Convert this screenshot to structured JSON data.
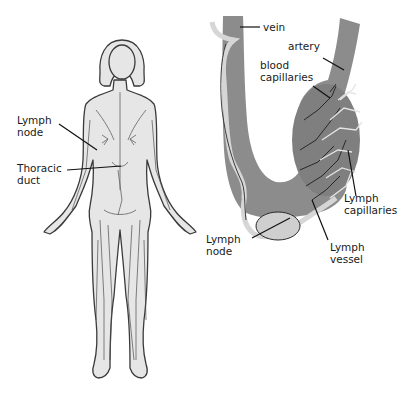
{
  "diagram": {
    "type": "anatomical-illustration",
    "colors": {
      "background": "#ffffff",
      "body_fill": "#e6e6e6",
      "outline": "#3a3a3a",
      "blood_vessel": "#8c8c8c",
      "lymph_vessel": "#d9d9d9",
      "lymph_node": "#cfcfcf",
      "leader_line": "#111111"
    },
    "left_panel": {
      "title": "female body lymphatic network",
      "labels": [
        {
          "id": "lymph_node",
          "line1": "Lymph",
          "line2": "node"
        },
        {
          "id": "thoracic_duct",
          "line1": "Thoracic",
          "line2": "duct"
        }
      ]
    },
    "right_panel": {
      "title": "blood vessels and lymph capillaries",
      "labels": [
        {
          "id": "vein",
          "line1": "vein",
          "line2": ""
        },
        {
          "id": "artery",
          "line1": "artery",
          "line2": ""
        },
        {
          "id": "blood_capillaries",
          "line1": "blood",
          "line2": "capillaries"
        },
        {
          "id": "lymph_capillaries",
          "line1": "Lymph",
          "line2": "capillaries"
        },
        {
          "id": "lymph_node",
          "line1": "Lymph",
          "line2": "node"
        },
        {
          "id": "lymph_vessel",
          "line1": "Lymph",
          "line2": "vessel"
        }
      ]
    }
  }
}
